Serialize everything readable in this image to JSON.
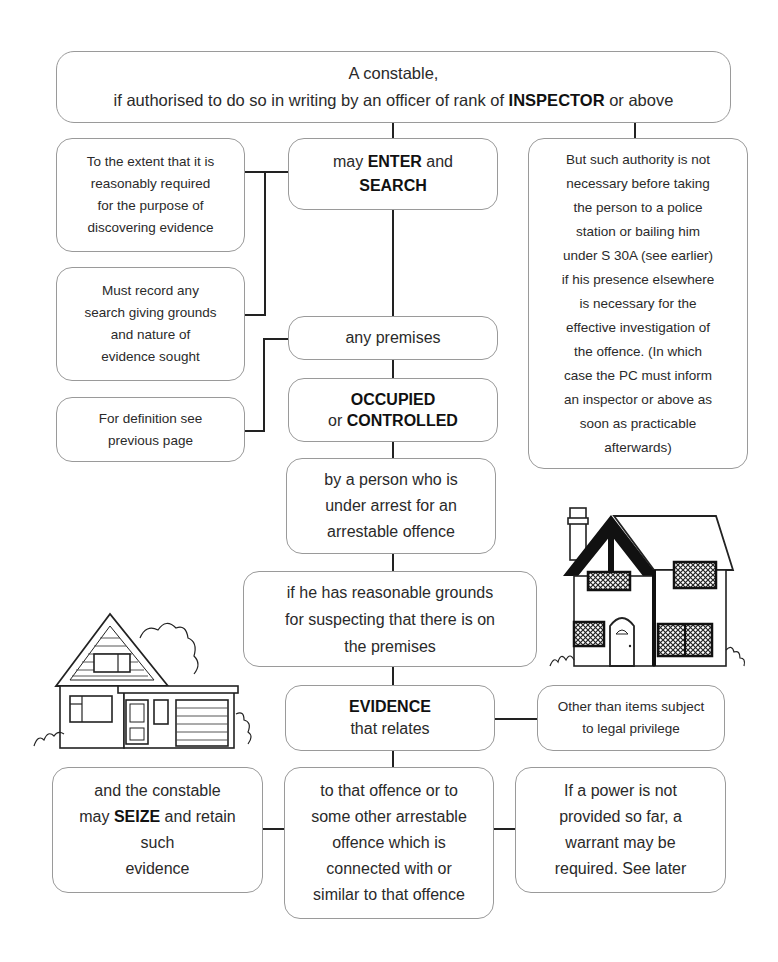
{
  "diagram": {
    "top": {
      "line1": "A constable,",
      "line2_pre": "if authorised to do so in writing by an officer of rank of ",
      "line2_bold": "INSPECTOR",
      "line2_post": " or above"
    },
    "enter_search": {
      "pre": "may ",
      "bold1": "ENTER",
      "mid": " and",
      "bold2": "SEARCH"
    },
    "extent": {
      "lines": [
        "To the extent that it is",
        "reasonably required",
        "for the purpose of",
        "discovering evidence"
      ]
    },
    "record": {
      "lines": [
        "Must record any",
        "search giving grounds",
        "and nature of",
        "evidence sought"
      ]
    },
    "definition": {
      "lines": [
        "For definition see",
        "previous page"
      ]
    },
    "authority": {
      "lines": [
        "But such authority is not",
        "necessary before taking",
        "the person to a police",
        "station or bailing him",
        "under S 30A (see earlier)",
        "if his presence elsewhere",
        "is necessary for the",
        "effective investigation of",
        "the offence. (In which",
        "case the PC must inform",
        "an inspector or above as",
        "soon as practicable",
        "afterwards)"
      ]
    },
    "premises": {
      "text": "any premises"
    },
    "occupied": {
      "bold1": "OCCUPIED",
      "pre2": "or ",
      "bold2": "CONTROLLED"
    },
    "person": {
      "lines": [
        "by a person who is",
        "under arrest for an",
        "arrestable offence"
      ]
    },
    "grounds": {
      "lines": [
        "if he has reasonable grounds",
        "for suspecting that there is on",
        "the premises"
      ]
    },
    "evidence": {
      "bold": "EVIDENCE",
      "line2": "that relates"
    },
    "privilege": {
      "lines": [
        "Other than items subject",
        "to legal privilege"
      ]
    },
    "seize": {
      "line1": "and the constable",
      "pre2": "may ",
      "bold2": "SEIZE",
      "post2": " and retain",
      "line3": "such",
      "line4": "evidence"
    },
    "offence": {
      "lines": [
        "to that offence or to",
        "some other arrestable",
        "offence which is",
        "connected with or",
        "similar to that offence"
      ]
    },
    "warrant": {
      "lines": [
        "If a power is not",
        "provided so far, a",
        "warrant may be",
        "required. See later"
      ]
    },
    "illustrations": [
      "tudor-house-icon",
      "bungalow-house-icon"
    ]
  }
}
